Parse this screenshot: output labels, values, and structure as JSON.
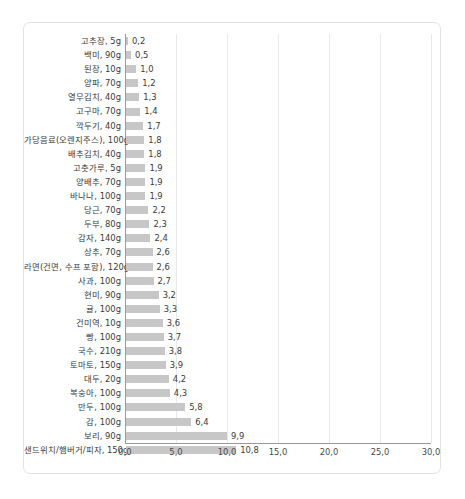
{
  "chart_data": {
    "type": "bar",
    "orientation": "horizontal",
    "title": "",
    "subtitle": "",
    "xlabel": "",
    "ylabel": "",
    "xlim": [
      0.0,
      30.0
    ],
    "grid": true,
    "legend": null,
    "xticks": [
      "0,0",
      "5,0",
      "10,0",
      "15,0",
      "20,0",
      "25,0",
      "30,0"
    ],
    "xtick_values": [
      0,
      5,
      10,
      15,
      20,
      25,
      30
    ],
    "bar_color": "#c7c7c7",
    "gridline_color": "#e9e9e9",
    "axis_color": "#9a9a9a",
    "categories": [
      "고추장, 5g",
      "백미, 90g",
      "된장, 10g",
      "양파, 70g",
      "열무김치, 40g",
      "고구마, 70g",
      "깍두기, 40g",
      "가당음료(오렌지주스), 100g",
      "배추김치, 40g",
      "고춧가루, 5g",
      "양배추, 70g",
      "바나나, 100g",
      "당근, 70g",
      "두부, 80g",
      "감자, 140g",
      "상추, 70g",
      "라면(건면, 수프 포함), 120g",
      "사과, 100g",
      "현미, 90g",
      "귤, 100g",
      "건미역, 10g",
      "빵, 100g",
      "국수, 210g",
      "토마토, 150g",
      "대두, 20g",
      "복숭아, 100g",
      "만두, 100g",
      "감, 100g",
      "보리, 90g",
      "샌드위치/햄버거/피자, 150g"
    ],
    "values": [
      0.2,
      0.5,
      1.0,
      1.2,
      1.3,
      1.4,
      1.7,
      1.8,
      1.8,
      1.9,
      1.9,
      1.9,
      2.2,
      2.3,
      2.4,
      2.6,
      2.6,
      2.7,
      3.2,
      3.3,
      3.6,
      3.7,
      3.8,
      3.9,
      4.2,
      4.3,
      5.8,
      6.4,
      9.9,
      10.8
    ],
    "value_labels": [
      "0,2",
      "0,5",
      "1,0",
      "1,2",
      "1,3",
      "1,4",
      "1,7",
      "1,8",
      "1,8",
      "1,9",
      "1,9",
      "1,9",
      "2,2",
      "2,3",
      "2,4",
      "2,6",
      "2,6",
      "2,7",
      "3,2",
      "3,3",
      "3,6",
      "3,7",
      "3,8",
      "3,9",
      "4,2",
      "4,3",
      "5,8",
      "6,4",
      "9,9",
      "10,8"
    ]
  }
}
